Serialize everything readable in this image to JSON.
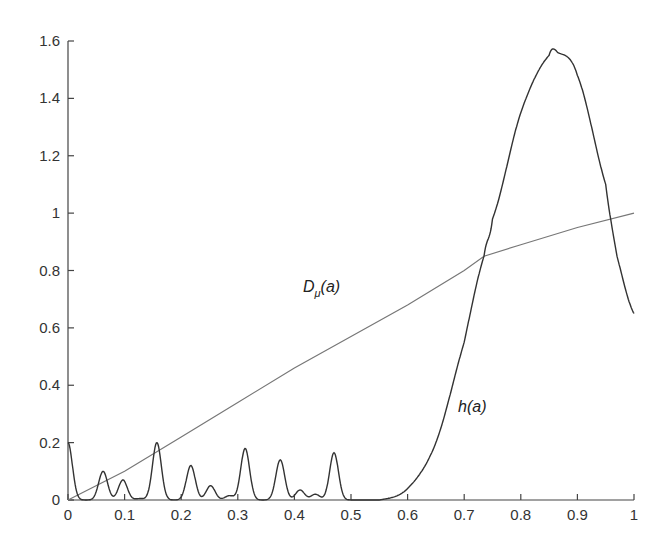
{
  "chart_data": {
    "type": "line",
    "title": "",
    "xlabel": "",
    "ylabel": "",
    "xlim": [
      0,
      1
    ],
    "ylim": [
      0,
      1.6
    ],
    "grid": false,
    "legend": "none (inline labels)",
    "x_ticks": [
      "0",
      "0.1",
      "0.2",
      "0.3",
      "0.4",
      "0.5",
      "0.6",
      "0.7",
      "0.8",
      "0.9",
      "1"
    ],
    "y_ticks": [
      "0",
      "0.2",
      "0.4",
      "0.6",
      "0.8",
      "1",
      "1.2",
      "1.4",
      "1.6"
    ],
    "series": [
      {
        "name": "D_μ(a)",
        "label_main": "D",
        "label_sub": "μ",
        "label_tail": "(a)",
        "color": "#777777",
        "x": [
          0,
          0.1,
          0.2,
          0.3,
          0.4,
          0.5,
          0.6,
          0.7,
          0.735,
          0.8,
          0.9,
          1.0
        ],
        "values": [
          0,
          0.1,
          0.22,
          0.34,
          0.46,
          0.57,
          0.68,
          0.8,
          0.85,
          0.89,
          0.95,
          1.0
        ]
      },
      {
        "name": "h(a)",
        "label": "h(a)",
        "color": "#333333",
        "peaks_left": [
          {
            "x": 0.0,
            "y": 0.2
          },
          {
            "x": 0.062,
            "y": 0.1
          },
          {
            "x": 0.097,
            "y": 0.07
          },
          {
            "x": 0.127,
            "y": 0.005
          },
          {
            "x": 0.157,
            "y": 0.2
          },
          {
            "x": 0.217,
            "y": 0.12
          },
          {
            "x": 0.252,
            "y": 0.05
          },
          {
            "x": 0.285,
            "y": 0.015
          },
          {
            "x": 0.313,
            "y": 0.18
          },
          {
            "x": 0.375,
            "y": 0.14
          },
          {
            "x": 0.41,
            "y": 0.035
          },
          {
            "x": 0.437,
            "y": 0.02
          },
          {
            "x": 0.47,
            "y": 0.165
          }
        ],
        "x": [
          0.5,
          0.55,
          0.6,
          0.65,
          0.7,
          0.735,
          0.75,
          0.8,
          0.85,
          0.865,
          0.9,
          0.95,
          0.97,
          1.0
        ],
        "values": [
          0,
          0,
          0.04,
          0.2,
          0.55,
          0.85,
          0.98,
          1.35,
          1.55,
          1.56,
          1.48,
          1.1,
          0.85,
          0.65
        ]
      }
    ]
  }
}
